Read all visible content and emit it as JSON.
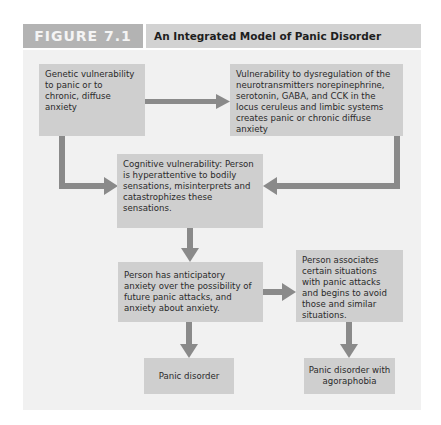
{
  "figure": {
    "label": "FIGURE 7.1",
    "title": "An Integrated Model of Panic Disorder"
  },
  "nodes": {
    "genetic": "Genetic vulnerability to panic or to chronic, diffuse anxiety",
    "neurotransmitter": "Vulnerability to dysregulation of the neurotransmitters norepinephrine, serotonin, GABA, and CCK in the locus ceruleus and limbic systems creates panic or chronic diffuse anxiety",
    "cognitive": "Cognitive vulnerability: Person is hyperattentive to bodily sensations, misinterprets and catastrophizes these sensations.",
    "anticipatory": "Person has anticipatory anxiety over the possibility of future panic attacks, and anxiety about anxiety.",
    "associates": "Person associates certain situations with panic attacks and begins to avoid those and similar situations.",
    "panic_disorder": "Panic disorder",
    "agoraphobia": "Panic disorder with agoraphobia"
  },
  "edges": [
    {
      "from": "genetic",
      "to": "neurotransmitter"
    },
    {
      "from": "genetic",
      "to": "cognitive"
    },
    {
      "from": "neurotransmitter",
      "to": "cognitive"
    },
    {
      "from": "cognitive",
      "to": "anticipatory"
    },
    {
      "from": "anticipatory",
      "to": "associates"
    },
    {
      "from": "anticipatory",
      "to": "panic_disorder"
    },
    {
      "from": "associates",
      "to": "agoraphobia"
    }
  ],
  "colors": {
    "label_bg": "#b3b3b3",
    "title_bg": "#d2d2d2",
    "panel_bg": "#f1f1f1",
    "box_bg": "#cfcfcf",
    "arrow": "#8a8a8a"
  }
}
